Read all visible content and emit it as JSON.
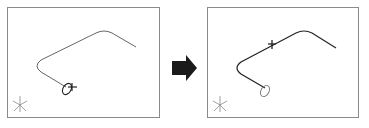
{
  "diagram": {
    "colors": {
      "frame": "#8a8a8a",
      "curve": "#555555",
      "curve_bold": "#222222",
      "arrow": "#1a1a1a",
      "triad": "#777777"
    },
    "panels": [
      {
        "id": "before",
        "marker": "cross-at-profile",
        "profile": "ellipse-at-start"
      },
      {
        "id": "after",
        "marker": "cross-on-path",
        "profile": "ellipse-at-start"
      }
    ],
    "arrow": {
      "direction": "right",
      "icon": "right-arrow-icon"
    },
    "triad": {
      "labels": [
        "x",
        "y",
        "z"
      ]
    }
  }
}
